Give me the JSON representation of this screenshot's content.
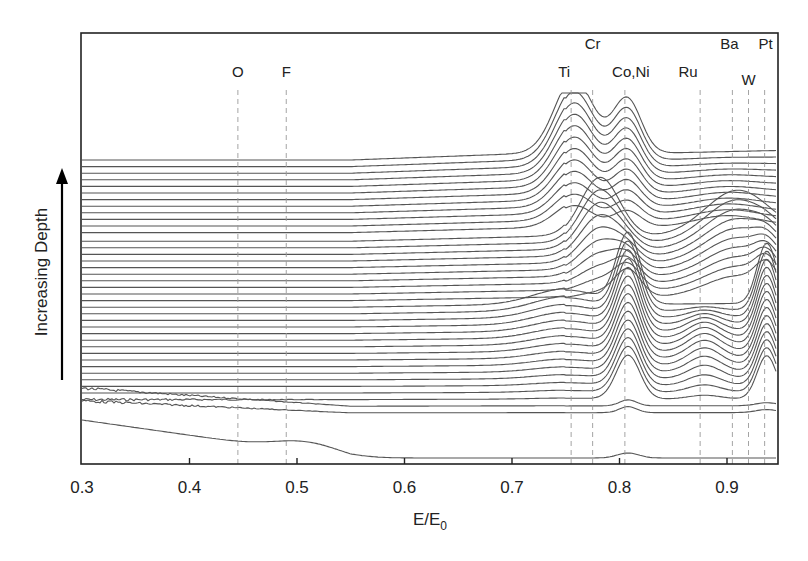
{
  "chart_data": {
    "type": "line",
    "title": "",
    "xlabel": "E/E0",
    "xlabel_main": "E/E",
    "xlabel_sub": "0",
    "ylabel": "Increasing Depth",
    "xlim": [
      0.3,
      0.95
    ],
    "x_ticks": [
      0.3,
      0.4,
      0.5,
      0.6,
      0.7,
      0.8,
      0.9
    ],
    "x_tick_labels": [
      "0.3",
      "0.4",
      "0.5",
      "0.6",
      "0.7",
      "0.8",
      "0.9"
    ],
    "grid": false,
    "legend": null,
    "y_ticks": "none (stacked offset spectra, depth arrow upward)",
    "series_count": 40,
    "element_markers": [
      {
        "label": "O",
        "x": 0.445,
        "row": 2
      },
      {
        "label": "F",
        "x": 0.49,
        "row": 2
      },
      {
        "label": "Ti",
        "x": 0.755,
        "row": 2
      },
      {
        "label": "Cr",
        "x": 0.775,
        "row": 1
      },
      {
        "label": "Co,Ni",
        "x": 0.805,
        "row": 2
      },
      {
        "label": "Ru",
        "x": 0.875,
        "row": 2
      },
      {
        "label": "Ba",
        "x": 0.905,
        "row": 1
      },
      {
        "label": "W",
        "x": 0.92,
        "row": 3
      },
      {
        "label": "Pt",
        "x": 0.935,
        "row": 1
      }
    ],
    "peak_features": [
      {
        "element": "Ti",
        "x": 0.758,
        "layers": "top ~12 traces",
        "rel_height": 1.0
      },
      {
        "element": "Co,Ni",
        "x": 0.807,
        "layers": "top ~12 traces, and middle-lower traces",
        "rel_height": 0.9
      },
      {
        "element": "Ba",
        "x": 0.91,
        "layers": "upper-middle traces",
        "rel_height": 0.7
      },
      {
        "element": "Cr",
        "x": 0.78,
        "layers": "upper-middle traces",
        "rel_height": 0.8
      },
      {
        "element": "Ru",
        "x": 0.878,
        "layers": "lower-middle traces",
        "rel_height": 0.45
      },
      {
        "element": "Pt",
        "x": 0.937,
        "layers": "middle-lower traces",
        "rel_height": 1.1
      }
    ]
  },
  "colors": {
    "line": "#555555",
    "frame": "#222222",
    "dash": "#9a9a9a",
    "text": "#222222"
  }
}
